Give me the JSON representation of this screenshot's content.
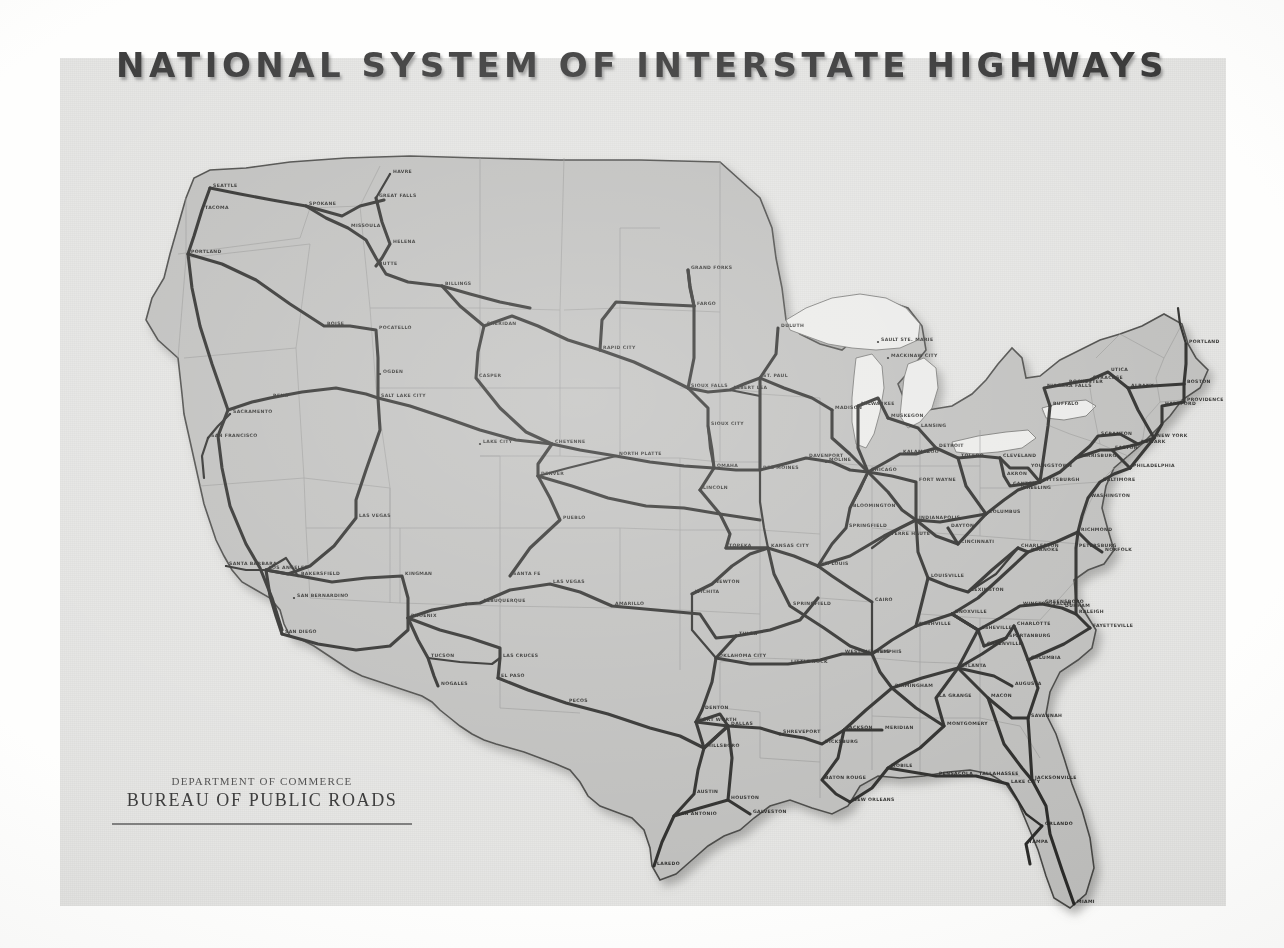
{
  "title": "NATIONAL SYSTEM OF INTERSTATE HIGHWAYS",
  "credit": {
    "department": "DEPARTMENT OF COMMERCE",
    "bureau": "BUREAU OF PUBLIC ROADS"
  },
  "map": {
    "subject": "Contiguous United States interstate highway network",
    "colors": {
      "paper": "#e3e3e1",
      "land": "#b9b9b7",
      "route": "#1d1d1b",
      "stateline": "#8e8e8c",
      "water": "#e9e9e7"
    },
    "cities": [
      {
        "name": "SEATTLE",
        "x": 150,
        "y": 130
      },
      {
        "name": "TACOMA",
        "x": 142,
        "y": 152
      },
      {
        "name": "PORTLAND",
        "x": 128,
        "y": 196
      },
      {
        "name": "SPOKANE",
        "x": 246,
        "y": 148
      },
      {
        "name": "GREAT FALLS",
        "x": 316,
        "y": 140
      },
      {
        "name": "HAVRE",
        "x": 330,
        "y": 116
      },
      {
        "name": "MISSOULA",
        "x": 288,
        "y": 170
      },
      {
        "name": "HELENA",
        "x": 330,
        "y": 186
      },
      {
        "name": "BUTTE",
        "x": 316,
        "y": 208
      },
      {
        "name": "BILLINGS",
        "x": 382,
        "y": 228
      },
      {
        "name": "SHERIDAN",
        "x": 424,
        "y": 268
      },
      {
        "name": "CASPER",
        "x": 416,
        "y": 320
      },
      {
        "name": "BOISE",
        "x": 264,
        "y": 268
      },
      {
        "name": "POCATELLO",
        "x": 316,
        "y": 272
      },
      {
        "name": "OGDEN",
        "x": 320,
        "y": 316
      },
      {
        "name": "SALT LAKE CITY",
        "x": 318,
        "y": 340
      },
      {
        "name": "RENO",
        "x": 210,
        "y": 340
      },
      {
        "name": "SACRAMENTO",
        "x": 170,
        "y": 356
      },
      {
        "name": "SAN FRANCISCO",
        "x": 148,
        "y": 380
      },
      {
        "name": "SANTA BARBARA",
        "x": 166,
        "y": 508
      },
      {
        "name": "LOS ANGELES",
        "x": 206,
        "y": 512
      },
      {
        "name": "BAKERSFIELD",
        "x": 238,
        "y": 518
      },
      {
        "name": "SAN BERNARDINO",
        "x": 234,
        "y": 540
      },
      {
        "name": "SAN DIEGO",
        "x": 222,
        "y": 576
      },
      {
        "name": "LAS VEGAS",
        "x": 296,
        "y": 460
      },
      {
        "name": "KINGMAN",
        "x": 342,
        "y": 518
      },
      {
        "name": "PHOENIX",
        "x": 348,
        "y": 560
      },
      {
        "name": "TUCSON",
        "x": 368,
        "y": 600
      },
      {
        "name": "NOGALES",
        "x": 378,
        "y": 628
      },
      {
        "name": "LAS CRUCES",
        "x": 440,
        "y": 600
      },
      {
        "name": "EL PASO",
        "x": 438,
        "y": 620
      },
      {
        "name": "PECOS",
        "x": 506,
        "y": 645
      },
      {
        "name": "ALBUQUERQUE",
        "x": 420,
        "y": 545
      },
      {
        "name": "SANTA FE",
        "x": 450,
        "y": 518
      },
      {
        "name": "LAS VEGAS NM",
        "x": 490,
        "y": 526
      },
      {
        "name": "AMARILLO",
        "x": 552,
        "y": 548
      },
      {
        "name": "DENVER",
        "x": 478,
        "y": 418
      },
      {
        "name": "PUEBLO",
        "x": 500,
        "y": 462
      },
      {
        "name": "CHEYENNE",
        "x": 492,
        "y": 386
      },
      {
        "name": "LAKE CITY",
        "x": 420,
        "y": 386
      },
      {
        "name": "NORTH PLATTE",
        "x": 556,
        "y": 398
      },
      {
        "name": "RAPID CITY",
        "x": 540,
        "y": 292
      },
      {
        "name": "GRAND FORKS",
        "x": 628,
        "y": 212
      },
      {
        "name": "FARGO",
        "x": 634,
        "y": 248
      },
      {
        "name": "SIOUX FALLS",
        "x": 628,
        "y": 330
      },
      {
        "name": "ALBERT LEA",
        "x": 670,
        "y": 332
      },
      {
        "name": "SIOUX CITY",
        "x": 648,
        "y": 368
      },
      {
        "name": "OMAHA",
        "x": 654,
        "y": 410
      },
      {
        "name": "LINCOLN",
        "x": 640,
        "y": 432
      },
      {
        "name": "DULUTH",
        "x": 718,
        "y": 270
      },
      {
        "name": "ST. PAUL",
        "x": 700,
        "y": 320
      },
      {
        "name": "SAULT STE. MARIE",
        "x": 818,
        "y": 284
      },
      {
        "name": "MACKINAW CITY",
        "x": 828,
        "y": 300
      },
      {
        "name": "DES MOINES",
        "x": 700,
        "y": 412
      },
      {
        "name": "DAVENPORT",
        "x": 746,
        "y": 400
      },
      {
        "name": "MOLINE",
        "x": 766,
        "y": 404
      },
      {
        "name": "MADISON",
        "x": 772,
        "y": 352
      },
      {
        "name": "MILWAUKEE",
        "x": 798,
        "y": 348
      },
      {
        "name": "MUSKEGON",
        "x": 828,
        "y": 360
      },
      {
        "name": "LANSING",
        "x": 858,
        "y": 370
      },
      {
        "name": "DETROIT",
        "x": 876,
        "y": 390
      },
      {
        "name": "KALAMAZOO",
        "x": 840,
        "y": 396
      },
      {
        "name": "CHICAGO",
        "x": 808,
        "y": 414
      },
      {
        "name": "TOLEDO",
        "x": 898,
        "y": 400
      },
      {
        "name": "CLEVELAND",
        "x": 940,
        "y": 400
      },
      {
        "name": "AKRON",
        "x": 944,
        "y": 418
      },
      {
        "name": "CANTON",
        "x": 950,
        "y": 428
      },
      {
        "name": "YOUNGSTOWN",
        "x": 968,
        "y": 410
      },
      {
        "name": "PITTSBURGH",
        "x": 980,
        "y": 424
      },
      {
        "name": "FORT WAYNE",
        "x": 856,
        "y": 424
      },
      {
        "name": "BLOOMINGTON",
        "x": 790,
        "y": 450
      },
      {
        "name": "SPRINGFIELD IL",
        "x": 786,
        "y": 470
      },
      {
        "name": "INDIANAPOLIS",
        "x": 856,
        "y": 462
      },
      {
        "name": "COLUMBUS",
        "x": 926,
        "y": 456
      },
      {
        "name": "DAYTON",
        "x": 888,
        "y": 470
      },
      {
        "name": "CINCINNATI",
        "x": 898,
        "y": 486
      },
      {
        "name": "TERRE HAUTE",
        "x": 828,
        "y": 478
      },
      {
        "name": "TOPEKA",
        "x": 666,
        "y": 490
      },
      {
        "name": "KANSAS CITY",
        "x": 708,
        "y": 490
      },
      {
        "name": "ST. LOUIS",
        "x": 758,
        "y": 508
      },
      {
        "name": "NEWTON",
        "x": 652,
        "y": 526
      },
      {
        "name": "WICHITA",
        "x": 632,
        "y": 536
      },
      {
        "name": "SPRINGFIELD MO",
        "x": 730,
        "y": 548
      },
      {
        "name": "CAIRO",
        "x": 812,
        "y": 544
      },
      {
        "name": "TULSA",
        "x": 676,
        "y": 578
      },
      {
        "name": "OKLAHOMA CITY",
        "x": 656,
        "y": 600
      },
      {
        "name": "LITTLE ROCK",
        "x": 728,
        "y": 606
      },
      {
        "name": "WEST MEMPHIS",
        "x": 782,
        "y": 596
      },
      {
        "name": "MEMPHIS",
        "x": 812,
        "y": 596
      },
      {
        "name": "NASHVILLE",
        "x": 856,
        "y": 568
      },
      {
        "name": "LEXINGTON",
        "x": 908,
        "y": 534
      },
      {
        "name": "LOUISVILLE",
        "x": 868,
        "y": 520
      },
      {
        "name": "CHARLESTON",
        "x": 958,
        "y": 490
      },
      {
        "name": "KNOXVILLE",
        "x": 892,
        "y": 556
      },
      {
        "name": "ASHEVILLE",
        "x": 918,
        "y": 572
      },
      {
        "name": "WINSTON-SALEM",
        "x": 960,
        "y": 548
      },
      {
        "name": "GREENSBORO",
        "x": 982,
        "y": 546
      },
      {
        "name": "DURHAM",
        "x": 1002,
        "y": 550
      },
      {
        "name": "RALEIGH",
        "x": 1016,
        "y": 556
      },
      {
        "name": "FAYETTEVILLE",
        "x": 1030,
        "y": 570
      },
      {
        "name": "GREENVILLE",
        "x": 924,
        "y": 588
      },
      {
        "name": "SPARTANBURG",
        "x": 946,
        "y": 580
      },
      {
        "name": "COLUMBIA",
        "x": 968,
        "y": 602
      },
      {
        "name": "CHARLOTTE",
        "x": 954,
        "y": 568
      },
      {
        "name": "ATLANTA",
        "x": 898,
        "y": 610
      },
      {
        "name": "AUGUSTA",
        "x": 952,
        "y": 628
      },
      {
        "name": "MACON",
        "x": 928,
        "y": 640
      },
      {
        "name": "SAVANNAH",
        "x": 968,
        "y": 660
      },
      {
        "name": "LA GRANGE",
        "x": 876,
        "y": 640
      },
      {
        "name": "BIRMINGHAM",
        "x": 832,
        "y": 630
      },
      {
        "name": "MONTGOMERY",
        "x": 884,
        "y": 668
      },
      {
        "name": "MERIDIAN",
        "x": 822,
        "y": 672
      },
      {
        "name": "JACKSON",
        "x": 784,
        "y": 672
      },
      {
        "name": "VICKSBURG",
        "x": 762,
        "y": 686
      },
      {
        "name": "SHREVEPORT",
        "x": 720,
        "y": 676
      },
      {
        "name": "BATON ROUGE",
        "x": 762,
        "y": 722
      },
      {
        "name": "NEW ORLEANS",
        "x": 790,
        "y": 744
      },
      {
        "name": "MOBILE",
        "x": 828,
        "y": 710
      },
      {
        "name": "PENSACOLA",
        "x": 876,
        "y": 718
      },
      {
        "name": "TALLAHASSEE",
        "x": 916,
        "y": 718
      },
      {
        "name": "LAKE CITY FL",
        "x": 948,
        "y": 726
      },
      {
        "name": "JACKSONVILLE",
        "x": 972,
        "y": 722
      },
      {
        "name": "ORLANDO",
        "x": 982,
        "y": 768
      },
      {
        "name": "TAMPA",
        "x": 966,
        "y": 786
      },
      {
        "name": "MIAMI",
        "x": 1014,
        "y": 846
      },
      {
        "name": "DENTON",
        "x": 642,
        "y": 652
      },
      {
        "name": "FORT WORTH",
        "x": 636,
        "y": 664
      },
      {
        "name": "DALLAS",
        "x": 668,
        "y": 668
      },
      {
        "name": "HILLSBORO",
        "x": 644,
        "y": 690
      },
      {
        "name": "AUSTIN",
        "x": 634,
        "y": 736
      },
      {
        "name": "HOUSTON",
        "x": 668,
        "y": 742
      },
      {
        "name": "GALVESTON",
        "x": 690,
        "y": 756
      },
      {
        "name": "SAN ANTONIO",
        "x": 614,
        "y": 758
      },
      {
        "name": "LAREDO",
        "x": 594,
        "y": 808
      },
      {
        "name": "NIAGARA FALLS",
        "x": 984,
        "y": 330
      },
      {
        "name": "ROCHESTER",
        "x": 1006,
        "y": 326
      },
      {
        "name": "BUFFALO",
        "x": 990,
        "y": 348
      },
      {
        "name": "SYRACUSE",
        "x": 1030,
        "y": 322
      },
      {
        "name": "UTICA",
        "x": 1048,
        "y": 314
      },
      {
        "name": "ALBANY",
        "x": 1068,
        "y": 330
      },
      {
        "name": "SCRANTON",
        "x": 1038,
        "y": 378
      },
      {
        "name": "EASTON",
        "x": 1052,
        "y": 392
      },
      {
        "name": "HARRISBURG",
        "x": 1016,
        "y": 400
      },
      {
        "name": "NEWARK",
        "x": 1078,
        "y": 386
      },
      {
        "name": "NEW YORK",
        "x": 1094,
        "y": 380
      },
      {
        "name": "BOSTON",
        "x": 1124,
        "y": 326
      },
      {
        "name": "PROVIDENCE",
        "x": 1124,
        "y": 344
      },
      {
        "name": "HARTFORD",
        "x": 1102,
        "y": 348
      },
      {
        "name": "PORTLAND ME",
        "x": 1126,
        "y": 286
      },
      {
        "name": "PHILADELPHIA",
        "x": 1070,
        "y": 410
      },
      {
        "name": "BALTIMORE",
        "x": 1040,
        "y": 424
      },
      {
        "name": "WASHINGTON",
        "x": 1028,
        "y": 440
      },
      {
        "name": "RICHMOND",
        "x": 1018,
        "y": 474
      },
      {
        "name": "NORFOLK",
        "x": 1042,
        "y": 494
      },
      {
        "name": "PETERSBURG",
        "x": 1016,
        "y": 490
      },
      {
        "name": "ROANOKE",
        "x": 968,
        "y": 494
      },
      {
        "name": "WHEELING",
        "x": 958,
        "y": 432
      }
    ]
  }
}
